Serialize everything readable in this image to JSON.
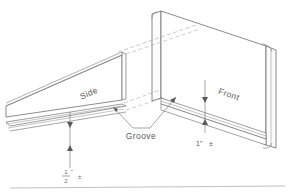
{
  "drawing": {
    "type": "isometric-technical-drawing",
    "subject": "Two panels with groove detail",
    "background_color": "#ffffff",
    "line_color": "#5a5a5a",
    "labels": {
      "side_panel": "Side",
      "front_panel": "Front",
      "groove": "Groove"
    },
    "dimensions": {
      "front_groove": {
        "value": "1\"",
        "tolerance": "±"
      },
      "side_groove": {
        "numerator": "1",
        "denominator": "2",
        "unit": "\"",
        "tolerance": "±"
      }
    }
  }
}
